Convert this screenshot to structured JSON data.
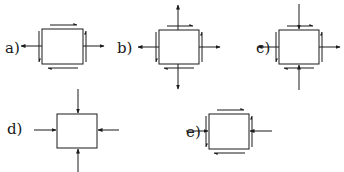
{
  "diagram": {
    "panels": [
      {
        "id": "a",
        "label": "a)",
        "normal_horizontal": "tension",
        "normal_vertical": "none",
        "shear": true
      },
      {
        "id": "b",
        "label": "b)",
        "normal_horizontal": "tension",
        "normal_vertical": "tension",
        "shear": true
      },
      {
        "id": "c",
        "label": "c)",
        "normal_horizontal": "tension",
        "normal_vertical": "compression",
        "shear": true
      },
      {
        "id": "d",
        "label": "d)",
        "normal_horizontal": "compression",
        "normal_vertical": "compression",
        "shear": false
      },
      {
        "id": "e",
        "label": "e)",
        "normal_horizontal": "compression",
        "normal_vertical": "none",
        "shear": true
      }
    ],
    "colors": {
      "stroke": "#1a1a1a",
      "background": "#ffffff"
    }
  }
}
